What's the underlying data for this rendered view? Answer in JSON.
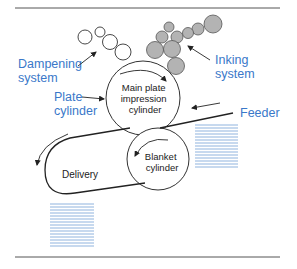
{
  "diagram": {
    "type": "offset printing press schematic",
    "labels": {
      "dampening": [
        "Dampening",
        "system"
      ],
      "inking": [
        "Inking",
        "system"
      ],
      "plate": [
        "Plate",
        "cylinder"
      ],
      "main_cylinder": [
        "Main plate",
        "impression",
        "cylinder"
      ],
      "blanket": [
        "Blanket",
        "cylinder"
      ],
      "feeder": "Feeder",
      "delivery": "Delivery"
    },
    "colors": {
      "label_blue": "#3a78c9",
      "ink_roller_fill": "#b3b3b3",
      "paper_stack": "#8fb3de",
      "line": "#333333"
    }
  }
}
